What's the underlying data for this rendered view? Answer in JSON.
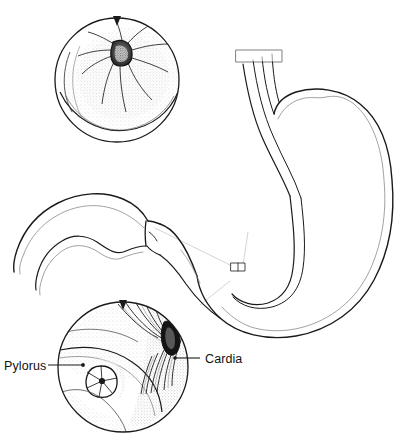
{
  "figure": {
    "background_color": "#ffffff",
    "ink_color": "#1a1a1a",
    "faint_guide_color": "#b9b9b9",
    "stipple_color": "#6b6b6b",
    "width": 405,
    "height": 441
  },
  "labels": [
    {
      "id": "pylorus",
      "text": "Pylorus",
      "text_x": 4,
      "text_y": 370,
      "anchor": "start",
      "leader_from_x": 48,
      "leader_from_y": 365,
      "leader_to_x": 82,
      "leader_to_y": 365,
      "dot_x": 83,
      "dot_y": 365
    },
    {
      "id": "cardia",
      "text": "Cardia",
      "text_x": 205,
      "text_y": 363,
      "anchor": "start",
      "leader_from_x": 200,
      "leader_from_y": 358,
      "leader_to_x": 176,
      "leader_to_y": 358,
      "dot_x": 175,
      "dot_y": 358
    }
  ],
  "insets": [
    {
      "id": "upper-inset",
      "name": "endoscopic-view-pylorus",
      "description": "Endoscopic view of pyloric opening with radiating mucosal folds",
      "center_x": 117,
      "center_y": 80,
      "radius": 62,
      "marker_x": 117,
      "marker_y": 18,
      "opening_center_x": 122,
      "opening_center_y": 52,
      "opening_rx": 10,
      "opening_ry": 12
    },
    {
      "id": "lower-inset",
      "name": "endoscopic-view-stomach-interior",
      "description": "Interior of stomach showing pyloric ring at left and cardia slit at upper right with converging rugal folds",
      "center_x": 123,
      "center_y": 367,
      "radius": 65,
      "marker_x": 123,
      "marker_y": 302,
      "pylorus_ring_x": 101,
      "pylorus_ring_y": 381,
      "pylorus_ring_r": 15,
      "cardia_slit_x": 170,
      "cardia_slit_y": 334
    }
  ],
  "organ": {
    "name": "stomach-with-duodenum",
    "parts": [
      {
        "id": "esophagus",
        "label": "esophagus"
      },
      {
        "id": "fundus",
        "label": "fundus"
      },
      {
        "id": "body",
        "label": "body"
      },
      {
        "id": "greater-curvature",
        "label": "greater curvature"
      },
      {
        "id": "lesser-curvature",
        "label": "lesser curvature"
      },
      {
        "id": "antrum",
        "label": "antrum"
      },
      {
        "id": "pyloric-sphincter",
        "label": "pyloric sphincter"
      },
      {
        "id": "duodenum",
        "label": "duodenum"
      }
    ]
  }
}
